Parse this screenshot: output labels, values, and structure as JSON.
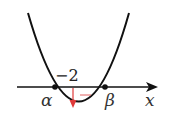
{
  "diagram": {
    "type": "parabola-graph",
    "axis": {
      "label": "x"
    },
    "roots": [
      {
        "label": "α"
      },
      {
        "label": "β"
      }
    ],
    "value_label": "−2",
    "red_mark": "—",
    "colors": {
      "curve": "#111111",
      "axis": "#111111",
      "arrow": "#e03a3a"
    }
  }
}
